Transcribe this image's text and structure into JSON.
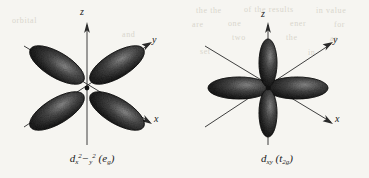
{
  "figure": {
    "background_color": "#f6f5f1",
    "ink_color": "#1a1a1a",
    "bleed_through_color": "#d9d6cd"
  },
  "panels": [
    {
      "id": "d-x2-y2",
      "caption": {
        "orbital_letter": "d",
        "subscript": "x",
        "sub_sup_1": "2",
        "minus": "−",
        "sub_2": "y",
        "sub_sup_2": "2",
        "symmetry_open": "(",
        "symmetry_letter": "e",
        "symmetry_sub": "g",
        "symmetry_close": ")",
        "plain_text": "d x2−y2 (eg)"
      },
      "axes": [
        {
          "name": "z",
          "label": "z",
          "direction": "up"
        },
        {
          "name": "y",
          "label": "y",
          "direction": "upper-right"
        },
        {
          "name": "x",
          "label": "x",
          "direction": "lower-right"
        }
      ],
      "lobes": 4,
      "lobe_arrangement": "diagonal-cross",
      "lobe_orientation_deg": [
        40,
        140,
        220,
        320
      ]
    },
    {
      "id": "d-xy",
      "caption": {
        "orbital_letter": "d",
        "subscript": "xy",
        "symmetry_open": "(",
        "symmetry_letter": "t",
        "symmetry_sub": "2g",
        "symmetry_close": ")",
        "plain_text": "d xy (t2g)"
      },
      "axes": [
        {
          "name": "z",
          "label": "z",
          "direction": "up"
        },
        {
          "name": "y",
          "label": "y",
          "direction": "upper-right"
        },
        {
          "name": "x",
          "label": "x",
          "direction": "lower-right"
        }
      ],
      "lobes": 4,
      "lobe_arrangement": "plus-cross",
      "lobe_orientation_deg": [
        0,
        90,
        180,
        270
      ]
    }
  ],
  "bleed_text": [
    {
      "text": "the the",
      "x": 196,
      "y": 6
    },
    {
      "text": "of the results",
      "x": 244,
      "y": 5
    },
    {
      "text": "in value",
      "x": 316,
      "y": 6
    },
    {
      "text": "are",
      "x": 192,
      "y": 20
    },
    {
      "text": "one",
      "x": 228,
      "y": 19
    },
    {
      "text": "ener",
      "x": 290,
      "y": 19
    },
    {
      "text": "for",
      "x": 334,
      "y": 20
    },
    {
      "text": "two",
      "x": 232,
      "y": 33
    },
    {
      "text": "the",
      "x": 286,
      "y": 33
    },
    {
      "text": "as",
      "x": 330,
      "y": 34
    },
    {
      "text": "set",
      "x": 200,
      "y": 47
    },
    {
      "text": "in",
      "x": 308,
      "y": 48
    },
    {
      "text": "orbital",
      "x": 12,
      "y": 16
    },
    {
      "text": "and",
      "x": 122,
      "y": 30
    }
  ]
}
